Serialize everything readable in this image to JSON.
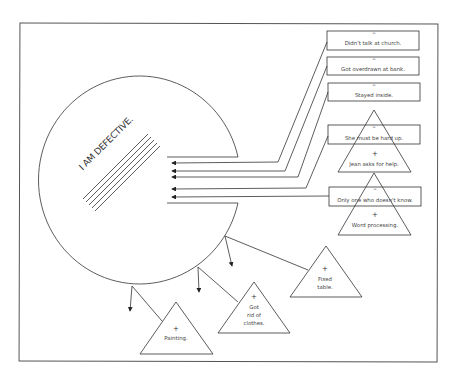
{
  "diagram": {
    "title": "",
    "core_belief": {
      "label": "I AM DEFECTIVE.",
      "shape": "circle-with-open-mouth"
    },
    "negative_evidence": [
      {
        "sign": "–",
        "label": "Didn't talk at church."
      },
      {
        "sign": "–",
        "label": "Got overdrawn at bank."
      },
      {
        "sign": "–",
        "label": "Stayed inside."
      },
      {
        "sign": "–",
        "label": "She must be hard up."
      },
      {
        "sign": "–",
        "label": "Only one who doesn't know."
      }
    ],
    "positive_evidence": [
      {
        "sign": "+",
        "label": "Jean asks for help."
      },
      {
        "sign": "+",
        "label": "Word processing."
      },
      {
        "sign": "+",
        "label": "Fixed table.",
        "lines": [
          "Fixed",
          "table."
        ]
      },
      {
        "sign": "+",
        "label": "Got rid of clothes.",
        "lines": [
          "Got",
          "rid of",
          "clothes."
        ]
      },
      {
        "sign": "+",
        "label": "Painting."
      }
    ],
    "legend": {
      "negative_meaning": "Negative evidence enters the circle (arrows in)",
      "positive_meaning": "Positive evidence deflected off the circle (arrows out)"
    },
    "colors": {
      "line": "#333333",
      "text": "#444444",
      "background": "#ffffff"
    }
  }
}
